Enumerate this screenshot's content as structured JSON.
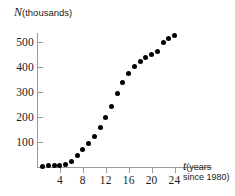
{
  "chart_data": {
    "type": "scatter",
    "title": "",
    "ylabel": "N (thousands)",
    "ylabel_variable": "N",
    "ylabel_unit": "(thousands)",
    "xlabel": "t (years since 1980)",
    "xlabel_variable": "t",
    "xlabel_unit_line1": "(years",
    "xlabel_unit_line2": "since 1980)",
    "xlim": [
      0,
      25.5
    ],
    "ylim": [
      0,
      545
    ],
    "grid": false,
    "legend": null,
    "marker_color": "#000000",
    "axis_color": "#9a9a9a",
    "background_color": "#ffffff",
    "xticks": [
      4,
      8,
      12,
      16,
      20,
      24
    ],
    "yticks": [
      100,
      200,
      300,
      400,
      500
    ],
    "x": [
      1,
      2,
      3,
      4,
      5,
      6,
      7,
      8,
      9,
      10,
      11,
      12,
      13,
      14,
      15,
      16,
      17,
      18,
      19,
      20,
      21,
      22,
      23,
      24
    ],
    "y": [
      4,
      5,
      6,
      8,
      11,
      22,
      45,
      72,
      95,
      122,
      160,
      200,
      243,
      294,
      340,
      375,
      404,
      424,
      440,
      452,
      462,
      500,
      516,
      525
    ],
    "points": [
      {
        "t": 1,
        "N": 4
      },
      {
        "t": 2,
        "N": 5
      },
      {
        "t": 3,
        "N": 6
      },
      {
        "t": 4,
        "N": 8
      },
      {
        "t": 5,
        "N": 11
      },
      {
        "t": 6,
        "N": 22
      },
      {
        "t": 7,
        "N": 45
      },
      {
        "t": 8,
        "N": 72
      },
      {
        "t": 9,
        "N": 95
      },
      {
        "t": 10,
        "N": 122
      },
      {
        "t": 11,
        "N": 160
      },
      {
        "t": 12,
        "N": 200
      },
      {
        "t": 13,
        "N": 243
      },
      {
        "t": 14,
        "N": 294
      },
      {
        "t": 15,
        "N": 340
      },
      {
        "t": 16,
        "N": 375
      },
      {
        "t": 17,
        "N": 404
      },
      {
        "t": 18,
        "N": 424
      },
      {
        "t": 19,
        "N": 440
      },
      {
        "t": 20,
        "N": 452
      },
      {
        "t": 21,
        "N": 462
      },
      {
        "t": 22,
        "N": 500
      },
      {
        "t": 23,
        "N": 516
      },
      {
        "t": 24,
        "N": 525
      }
    ]
  },
  "axes": {
    "origin_px": {
      "x": 37,
      "y": 167
    },
    "x_unit_px": 5.73,
    "y_unit_px": 0.25
  }
}
